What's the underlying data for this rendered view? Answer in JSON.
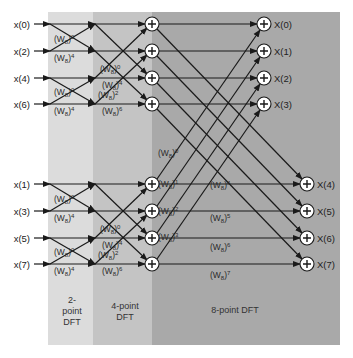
{
  "inputs_top": [
    "x(0)",
    "x(2)",
    "x(4)",
    "x(6)"
  ],
  "inputs_bottom": [
    "x(1)",
    "x(3)",
    "x(5)",
    "x(7)"
  ],
  "outputs_top": [
    "X(0)",
    "X(1)",
    "X(2)",
    "X(3)"
  ],
  "outputs_bottom": [
    "X(4)",
    "X(5)",
    "X(6)",
    "X(7)"
  ],
  "stages": {
    "two_point": [
      "2-",
      "point",
      "DFT"
    ],
    "four_point": [
      "4-point",
      "DFT"
    ],
    "eight_point": "8-point DFT"
  },
  "twiddles": {
    "w0": "(W8)0",
    "base": "(W",
    "sub": "8",
    "close": ")",
    "stage1": [
      "0",
      "4",
      "0",
      "4"
    ],
    "stage2": [
      "0",
      "4",
      "2",
      "6"
    ],
    "stage3_cross": [
      "0",
      "1",
      "2",
      "3"
    ],
    "stage3_straight": [
      "4",
      "5",
      "6",
      "7"
    ]
  },
  "plus_symbol": "+",
  "colors": {
    "panel_2pt": "#dcdcdc",
    "panel_4pt": "#c4c4c4",
    "panel_8pt": "#a9a9a9",
    "line": "#1a1a1a",
    "node_fill": "#ffffff"
  }
}
